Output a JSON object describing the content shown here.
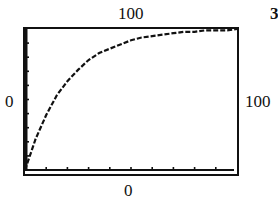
{
  "problem_number": "3",
  "window_labels": {
    "ymax": "100",
    "xmin": "0",
    "xmax": "100",
    "ymin": "0"
  },
  "chart_data": {
    "type": "line",
    "title": "",
    "xlabel": "",
    "ylabel": "",
    "xlim": [
      0,
      100
    ],
    "ylim": [
      0,
      100
    ],
    "x_tick_step": 10,
    "y_tick_step": 10,
    "grid": false,
    "style": "graphing-calculator stepped pixel curve",
    "series": [
      {
        "name": "curve",
        "x": [
          0,
          5,
          10,
          15,
          20,
          25,
          30,
          35,
          40,
          45,
          50,
          55,
          60,
          65,
          70,
          75,
          80,
          85,
          90,
          95,
          100
        ],
        "values": [
          0,
          22,
          39,
          53,
          63,
          71,
          78,
          83,
          86,
          89,
          92,
          94,
          95,
          96,
          97,
          98,
          98,
          99,
          99,
          99,
          100
        ]
      }
    ]
  }
}
